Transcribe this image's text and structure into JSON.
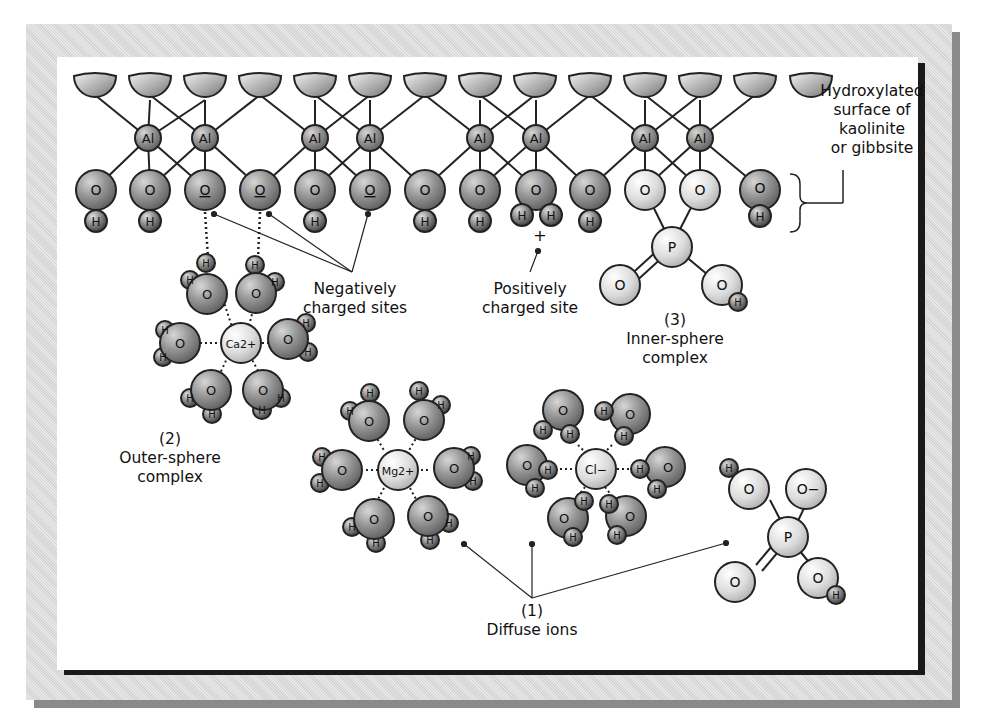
{
  "figure": {
    "surface_label": [
      "Hydroxylated",
      "surface of",
      "kaolinite",
      "or gibbsite"
    ],
    "negative_sites_label": [
      "Negatively",
      "charged sites"
    ],
    "positive_site_label": [
      "Positively",
      "charged site"
    ],
    "inner_sphere": {
      "number": "(3)",
      "name": [
        "Inner-sphere",
        "complex"
      ]
    },
    "outer_sphere": {
      "number": "(2)",
      "name": [
        "Outer-sphere",
        "complex"
      ]
    },
    "diffuse": {
      "number": "(1)",
      "name": "Diffuse ions"
    },
    "atoms": {
      "aluminum": "Al",
      "oxygen": "O",
      "hydrogen": "H",
      "phosphorus": "P",
      "calcium_ion": "Ca2+",
      "magnesium_ion": "Mg2+",
      "chloride_ion": "Cl−",
      "oxygen_anion": "O−",
      "positive_charge": "+"
    },
    "colors": {
      "dark_atom": "#8c8c8c",
      "light_atom": "#dedede",
      "outline": "#222222",
      "frame": "#dcdcdc",
      "frame_shadow": "#8a8a8a",
      "panel_shadow": "#1a1a1a"
    }
  }
}
